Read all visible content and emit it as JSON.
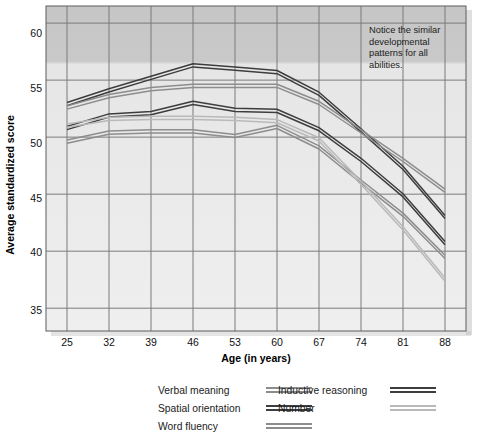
{
  "chart_data": {
    "type": "line",
    "title": "",
    "xlabel": "Age (in years)",
    "ylabel": "Average standardized score",
    "x": [
      25,
      32,
      39,
      46,
      53,
      60,
      67,
      74,
      81,
      88
    ],
    "xticklabels": [
      "25",
      "32",
      "39",
      "46",
      "53",
      "60",
      "67",
      "74",
      "81",
      "88"
    ],
    "yticklabels": [
      "35",
      "40",
      "45",
      "50",
      "55",
      "60"
    ],
    "ylim": [
      33.0,
      61.5
    ],
    "xlim": [
      21.5,
      91.5
    ],
    "grid": true,
    "legend_position": "below-plot",
    "annotations": [
      {
        "text": "Notice the similar developmental patterns for all abilities.",
        "x": 82,
        "y": 58
      }
    ],
    "series": [
      {
        "name": "Inductive reasoning",
        "color": "#3d3d3d",
        "values": [
          52.9,
          54.1,
          55.2,
          56.3,
          56.0,
          55.7,
          53.8,
          50.6,
          47.3,
          43.0
        ]
      },
      {
        "name": "Verbal meaning",
        "color": "#8d8d8d",
        "values": [
          52.6,
          53.6,
          54.2,
          54.5,
          54.5,
          54.5,
          53.0,
          50.5,
          48.0,
          45.3
        ]
      },
      {
        "name": "Spatial orientation",
        "color": "#3d3d3d",
        "values": [
          50.8,
          51.9,
          52.1,
          53.0,
          52.4,
          52.3,
          50.7,
          48.0,
          44.9,
          40.7
        ]
      },
      {
        "name": "Word fluency",
        "color": "#8d8d8d",
        "values": [
          49.6,
          50.4,
          50.5,
          50.5,
          50.1,
          50.9,
          49.1,
          46.1,
          43.2,
          39.5
        ]
      },
      {
        "name": "Number",
        "color": "#b9b9b9",
        "values": [
          51.0,
          51.6,
          51.7,
          51.7,
          51.6,
          51.4,
          49.8,
          46.0,
          42.0,
          37.5
        ]
      }
    ]
  },
  "legend": {
    "columns": [
      [
        {
          "label": "Verbal meaning",
          "color": "#8d8d8d"
        },
        {
          "label": "Spatial orientation",
          "color": "#3d3d3d"
        },
        {
          "label": "Word fluency",
          "color": "#8d8d8d"
        }
      ],
      [
        {
          "label": "Inductive reasoning",
          "color": "#3d3d3d"
        },
        {
          "label": "Number",
          "color": "#b9b9b9"
        }
      ]
    ]
  },
  "annotation": {
    "line1": "Notice the similar",
    "line2": "developmental",
    "line3": "patterns for all",
    "line4": "abilities."
  },
  "axes": {
    "ylabel": "Average standardized score",
    "xlabel": "Age (in years)"
  },
  "colors": {
    "plot_bg": "#ebebeb",
    "plot_bg_top": "#c9c9c9",
    "grid": "#7b7b7b",
    "dark_line": "#3d3d3d",
    "mid_line": "#8d8d8d",
    "light_line": "#b9b9b9"
  }
}
